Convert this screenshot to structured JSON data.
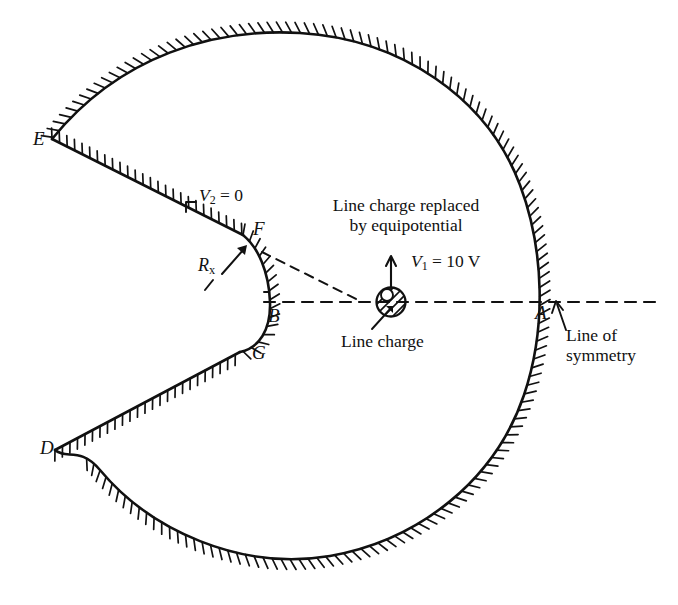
{
  "figure": {
    "background_color": "#ffffff",
    "stroke_color": "#111111"
  },
  "points": [
    {
      "id": "A",
      "label": "A",
      "x": 541,
      "y": 316,
      "desc": "right arc intersection with line of symmetry"
    },
    {
      "id": "B",
      "label": "B",
      "x": 268,
      "y": 324,
      "desc": "cusp apex on line of symmetry"
    },
    {
      "id": "D",
      "label": "D",
      "x": 47,
      "y": 451,
      "desc": "lower outer corner"
    },
    {
      "id": "E",
      "label": "E",
      "x": 40,
      "y": 142,
      "desc": "upper outer corner"
    },
    {
      "id": "F",
      "label": "F",
      "x": 258,
      "y": 240,
      "desc": "upper inner edge point"
    },
    {
      "id": "G",
      "label": "G",
      "x": 252,
      "y": 360,
      "desc": "lower inner edge point"
    }
  ],
  "annotations": {
    "v2": {
      "text": "V2 = 0",
      "math": {
        "symbol": "V",
        "subscript": "2",
        "relation": " = ",
        "value": "0"
      },
      "x": 196,
      "y": 196
    },
    "v1": {
      "text": "V1 = 10 V",
      "math": {
        "symbol": "V",
        "subscript": "1",
        "relation": " = ",
        "value": "10 V"
      },
      "x": 408,
      "y": 255
    },
    "rx": {
      "text": "Rx",
      "math": {
        "symbol": "R",
        "subscript": "x"
      },
      "x": 200,
      "y": 258
    },
    "equipotential_note": {
      "line1": "Line charge replaced",
      "line2": "by equipotential",
      "x": 300,
      "y": 200
    },
    "line_charge": {
      "text": "Line charge",
      "x": 341,
      "y": 333
    },
    "line_of_symmetry": {
      "line1": "Line of",
      "line2": "symmetry",
      "x": 563,
      "y": 312
    }
  },
  "elements": {
    "line_charge_marker": {
      "name": "line-charge-circle",
      "cx": 391,
      "cy": 302,
      "r": 15,
      "hatched": true
    },
    "symmetry_axis": {
      "name": "line-of-symmetry",
      "y": 302,
      "x_start": 265,
      "x_end": 660,
      "style": "dashed"
    },
    "equipotential_triangle": {
      "style": "dashed",
      "apex_x": 278,
      "apex_y": 258
    },
    "conductor_outline": {
      "hatching": "inclined ticks on conductor side",
      "style": "solid"
    }
  }
}
